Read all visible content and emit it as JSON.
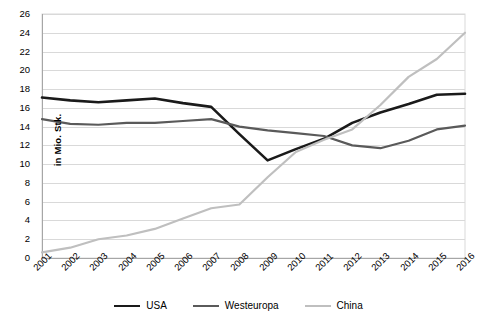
{
  "chart_data": {
    "type": "line",
    "title": "",
    "xlabel": "",
    "ylabel": "in Mio. Stk.",
    "ylim": [
      0,
      26
    ],
    "ytick_step": 2,
    "grid": "horizontal",
    "legend_position": "bottom",
    "categories": [
      "2001",
      "2002",
      "2003",
      "2004",
      "2005",
      "2006",
      "2007",
      "2008",
      "2009",
      "2010",
      "2011",
      "2012",
      "2013",
      "2014",
      "2015",
      "2016"
    ],
    "yticks": [
      "0",
      "2",
      "4",
      "6",
      "8",
      "10",
      "12",
      "14",
      "16",
      "18",
      "20",
      "22",
      "24",
      "26"
    ],
    "series": [
      {
        "name": "USA",
        "color": "#1a1a1a",
        "width": 2.6,
        "values": [
          17.1,
          16.8,
          16.6,
          16.8,
          17.0,
          16.5,
          16.1,
          13.2,
          10.4,
          11.6,
          12.7,
          14.4,
          15.5,
          16.4,
          17.4,
          17.5
        ]
      },
      {
        "name": "Westeuropa",
        "color": "#5a5a5a",
        "width": 2.2,
        "values": [
          14.8,
          14.3,
          14.2,
          14.4,
          14.4,
          14.6,
          14.8,
          14.0,
          13.6,
          13.3,
          13.0,
          12.0,
          11.7,
          12.5,
          13.7,
          14.1
        ]
      },
      {
        "name": "China",
        "color": "#bfbfbf",
        "width": 2.2,
        "values": [
          0.6,
          1.1,
          2.0,
          2.4,
          3.1,
          4.2,
          5.3,
          5.7,
          8.6,
          11.3,
          12.6,
          13.7,
          16.3,
          19.3,
          21.2,
          24.0
        ]
      }
    ]
  }
}
